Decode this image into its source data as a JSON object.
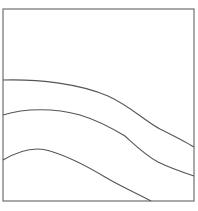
{
  "diagram": {
    "frame": {
      "x": 3,
      "y": 9,
      "width": 191,
      "height": 192,
      "stroke": "#707070"
    },
    "line_color": "#555555",
    "curves": [
      {
        "name": "upper-curve",
        "d": "M3,80 C40,79 80,84 108,96 C130,106 145,121 160,129 C172,135 184,141 194,147"
      },
      {
        "name": "middle-curve",
        "d": "M3,115 C25,108 55,108 80,115 C100,121 115,130 125,136 C135,145 145,155 158,162 C170,168 182,172 194,176"
      },
      {
        "name": "lower-curve",
        "d": "M3,160 C20,150 35,146 50,151 C70,157 90,168 105,177 C120,186 138,194 151,201"
      }
    ]
  }
}
